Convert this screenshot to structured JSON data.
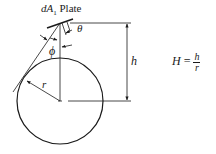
{
  "diagram": {
    "labels": {
      "plate_element": "dA",
      "plate_subscript": "1",
      "plate_word": "Plate",
      "theta": "θ",
      "phi": "ϕ",
      "height": "h",
      "radius": "r"
    },
    "formula": {
      "lhs": "H",
      "equals": "=",
      "numerator": "h",
      "denominator": "r"
    },
    "colors": {
      "line": "#1a1a1a",
      "background": "#ffffff"
    }
  }
}
